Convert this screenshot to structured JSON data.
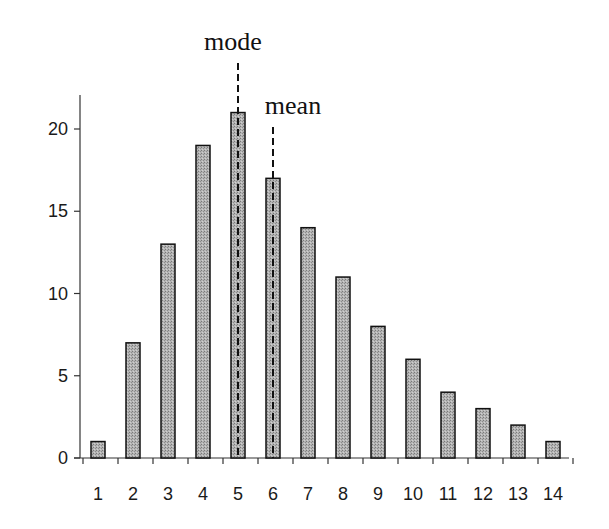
{
  "chart_data": {
    "type": "bar",
    "title": "",
    "xlabel": "",
    "ylabel": "",
    "categories": [
      "1",
      "2",
      "3",
      "4",
      "5",
      "6",
      "7",
      "8",
      "9",
      "10",
      "11",
      "12",
      "13",
      "14"
    ],
    "values": [
      1,
      7,
      13,
      19,
      21,
      17,
      14,
      11,
      8,
      6,
      4,
      3,
      2,
      1
    ],
    "ylim": [
      0,
      22
    ],
    "yticks": [
      0,
      5,
      10,
      15,
      20
    ],
    "grid": false,
    "legend": null,
    "bar_fill": "#a8a8a8",
    "bar_stroke": "#111111",
    "annotations": [
      {
        "label": "mode",
        "category": "5",
        "style": "dashed-vertical-line"
      },
      {
        "label": "mean",
        "category": "6",
        "style": "dashed-vertical-line"
      }
    ]
  }
}
